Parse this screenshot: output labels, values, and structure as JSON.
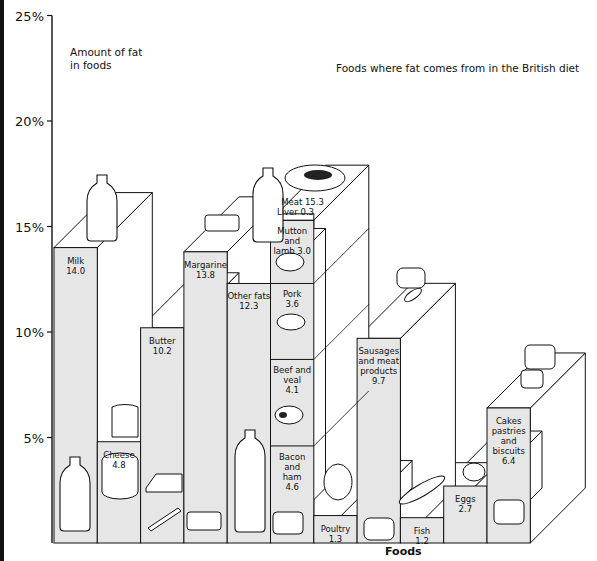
{
  "chart_data": {
    "type": "bar",
    "subtype": "3d-stacked-pictorial-bar",
    "title": "Foods where fat comes from in the British diet",
    "ylabel": "Amount of fat in foods",
    "xlabel": "Foods",
    "ylim": [
      0,
      25
    ],
    "yticks": [
      "5%",
      "10%",
      "15%",
      "20%",
      "25%"
    ],
    "grid": false,
    "legend": "none",
    "categories": [
      "Milk",
      "Cheese",
      "Butter",
      "Margarine",
      "Other fats",
      "Meat",
      "Poultry",
      "Sausages and meat products",
      "Fish",
      "Eggs",
      "Cakes pastries and biscuits"
    ],
    "values": [
      14.0,
      4.8,
      10.2,
      13.8,
      12.3,
      15.3,
      1.3,
      9.7,
      1.2,
      2.7,
      6.4
    ],
    "labels": [
      "Milk\n14.0",
      "Cheese\n4.8",
      "Butter\n10.2",
      "Margarine\n13.8",
      "Other fats\n12.3",
      "Meat 15.3",
      "Poultry\n1.3",
      "Sausages\nand meat\nproducts\n9.7",
      "Fish\n1.2",
      "Eggs\n2.7",
      "Cakes\npastries\nand biscuits\n6.4"
    ],
    "meat_breakdown": {
      "total_label": "Meat 15.3",
      "liver_label": "Liver 0.3",
      "segments": [
        {
          "name": "Bacon and ham",
          "value": 4.6,
          "label": "Bacon and\nham\n4.6"
        },
        {
          "name": "Beef and veal",
          "value": 4.1,
          "label": "Beef and\nveal\n4.1"
        },
        {
          "name": "Pork",
          "value": 3.6,
          "label": "Pork\n3.6"
        },
        {
          "name": "Mutton and lamb",
          "value": 3.0,
          "label": "Mutton and\nlamb  3.0"
        },
        {
          "name": "Liver",
          "value": 0.3,
          "label": "Liver 0.3"
        }
      ]
    },
    "colors": {
      "front_face": "#e6e6e6",
      "side_face": "#ffffff",
      "outline": "#111111"
    }
  }
}
